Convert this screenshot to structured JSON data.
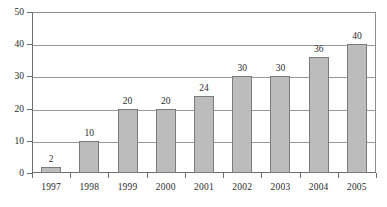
{
  "chart_data": {
    "type": "bar",
    "title": "",
    "subtitle": "",
    "xlabel": "",
    "ylabel": "",
    "categories": [
      "1997",
      "1998",
      "1999",
      "2000",
      "2001",
      "2002",
      "2003",
      "2004",
      "2005"
    ],
    "values": [
      2,
      10,
      20,
      20,
      24,
      30,
      30,
      36,
      40
    ],
    "value_labels": [
      "2",
      "10",
      "20",
      "20",
      "24",
      "30",
      "30",
      "36",
      "40"
    ],
    "ylim": [
      0,
      50
    ],
    "ytick_values": [
      0,
      10,
      20,
      30,
      40,
      50
    ],
    "ytick_labels": [
      "0",
      "10",
      "20",
      "30",
      "40",
      "50"
    ],
    "grid": true,
    "grid_axis": "y",
    "legend": false,
    "legend_position": "none",
    "data_labels_shown": true,
    "annotations": []
  },
  "style": {
    "bar_fill": "#bcbcbc",
    "bar_border": "#7b7b7b",
    "gridline_color": "#9a9a9a",
    "axis_color": "#6e6e6e",
    "plot_background": "#ffffff",
    "text_color": "#2b2b2b"
  }
}
